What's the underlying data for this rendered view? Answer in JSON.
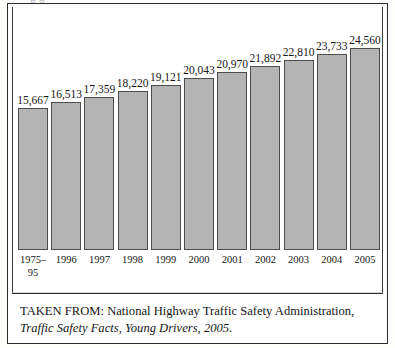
{
  "figure": {
    "clipped_title_fragment": "g  g",
    "source_prefix": "TAKEN FROM: National Highway Traffic Safety Administration, ",
    "source_title": "Traffic Safety Facts, Young Drivers, 2005",
    "source_suffix": "."
  },
  "chart_data": {
    "type": "bar",
    "title": "",
    "subtitle": "",
    "xlabel": "",
    "ylabel": "",
    "categories": [
      "1975–\n95",
      "1996",
      "1997",
      "1998",
      "1999",
      "2000",
      "2001",
      "2002",
      "2003",
      "2004",
      "2005"
    ],
    "values": [
      15667,
      16513,
      17359,
      18220,
      19121,
      20043,
      20970,
      21892,
      22810,
      23733,
      24560
    ],
    "value_labels": [
      "15,667",
      "16,513",
      "17,359",
      "18,220",
      "19,121",
      "20,043",
      "20,970",
      "21,892",
      "22,810",
      "23,733",
      "24,560"
    ],
    "bar_fill_color": "#b4b4b4",
    "bar_border_color": "#4d4d4d",
    "axis_baseline_value": -5370,
    "ylim": [
      -5370,
      24560
    ],
    "grid": false,
    "legend": false,
    "y_axis_visible": false,
    "data_labels_shown": true
  }
}
